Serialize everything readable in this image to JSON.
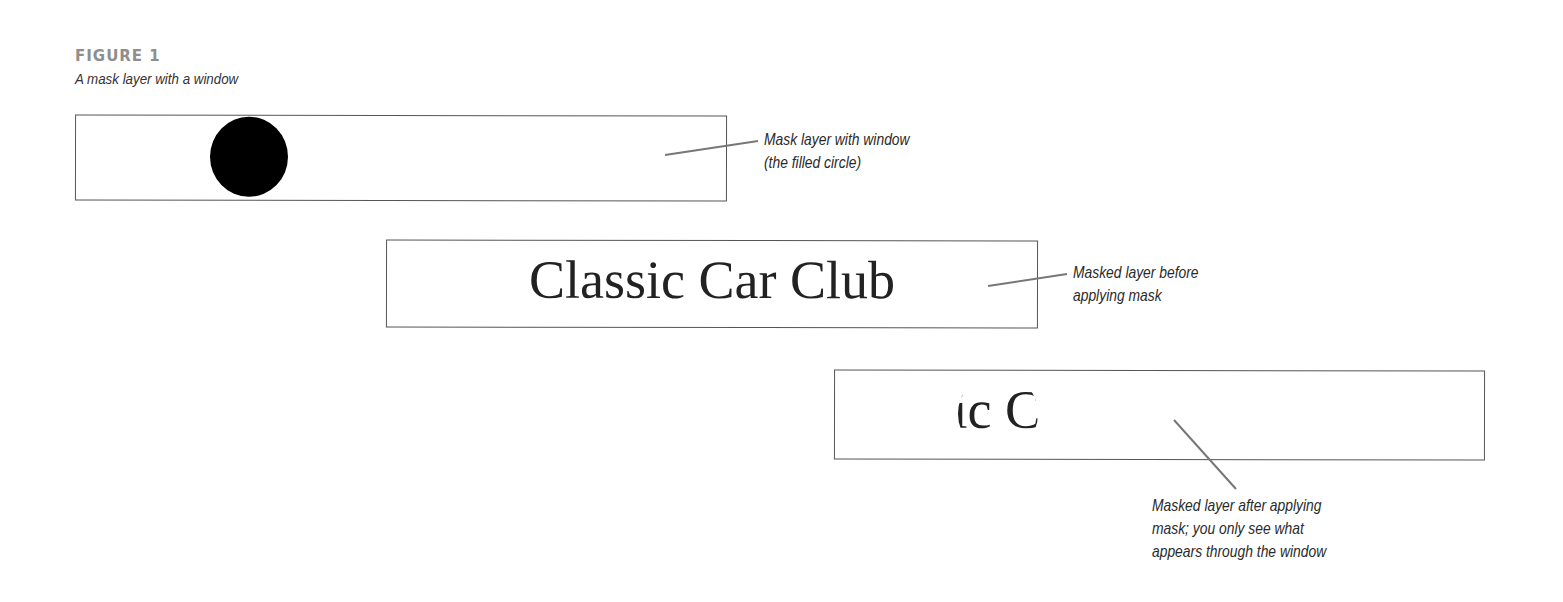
{
  "figure": {
    "number": "FIGURE 1",
    "caption": "A mask layer with a window"
  },
  "panels": [
    {
      "id": "mask-layer",
      "content": "filled-circle",
      "callout": [
        "Mask layer with window",
        "(the filled circle)"
      ]
    },
    {
      "id": "masked-layer-before",
      "text": "Classic Car Club",
      "callout": [
        "Masked layer before",
        "applying mask"
      ]
    },
    {
      "id": "masked-layer-after",
      "text": "Classic Car Club",
      "visible_fragment": "Clas",
      "callout": [
        "Masked layer after applying",
        "mask; you only see what",
        "appears through the window"
      ]
    }
  ],
  "colors": {
    "figure_label": "#8e8e8e",
    "box_border": "#555555",
    "leader_line": "#777777",
    "mask_fill": "#000000",
    "text": "#222222"
  }
}
